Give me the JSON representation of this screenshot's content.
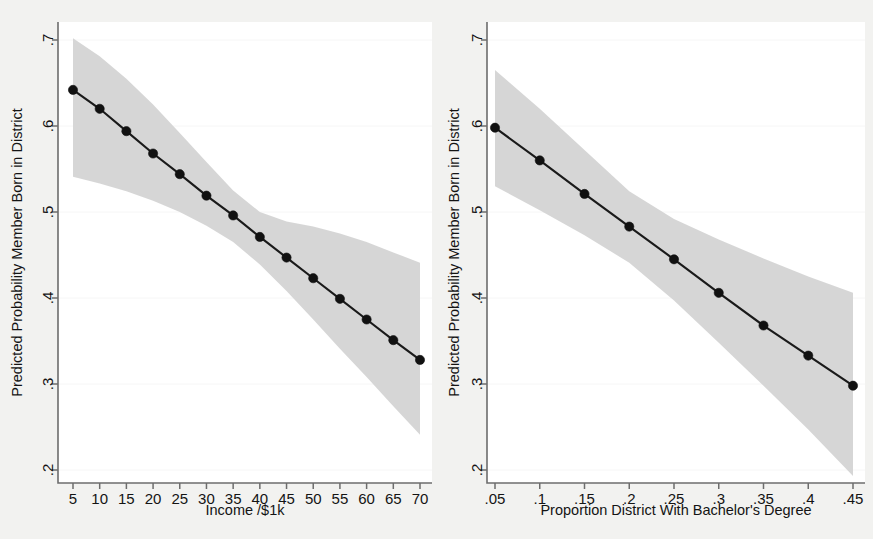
{
  "figure": {
    "background_color": "#f2f2f0",
    "plot_background_color": "#ffffff",
    "band_color": "#d4d4d4",
    "line_color": "#1a1a1a",
    "axis_color": "#6d6d6d"
  },
  "chart_data": [
    {
      "type": "line",
      "panel": "left",
      "title": "",
      "xlabel": "Income /$1k",
      "ylabel": "Predicted Probability Member Born in District",
      "xlim": [
        5,
        70
      ],
      "ylim": [
        0.2,
        0.7
      ],
      "xticks": [
        5,
        10,
        15,
        20,
        25,
        30,
        35,
        40,
        45,
        50,
        55,
        60,
        65,
        70
      ],
      "xticklabels": [
        "5",
        "10",
        "15",
        "20",
        "25",
        "30",
        "35",
        "40",
        "45",
        "50",
        "55",
        "60",
        "65",
        "70"
      ],
      "yticks": [
        0.2,
        0.3,
        0.4,
        0.5,
        0.6,
        0.7
      ],
      "yticklabels": [
        ".2",
        ".3",
        ".4",
        ".5",
        ".6",
        ".7"
      ],
      "grid": false,
      "legend": "none",
      "x": [
        5,
        10,
        15,
        20,
        25,
        30,
        35,
        40,
        45,
        50,
        55,
        60,
        65,
        70
      ],
      "values": [
        0.642,
        0.62,
        0.594,
        0.568,
        0.544,
        0.519,
        0.496,
        0.471,
        0.447,
        0.423,
        0.399,
        0.375,
        0.351,
        0.328
      ],
      "ci_upper": [
        0.702,
        0.681,
        0.655,
        0.625,
        0.592,
        0.558,
        0.525,
        0.5,
        0.489,
        0.483,
        0.475,
        0.465,
        0.453,
        0.441
      ],
      "ci_lower": [
        0.541,
        0.533,
        0.524,
        0.513,
        0.5,
        0.484,
        0.465,
        0.439,
        0.408,
        0.375,
        0.341,
        0.308,
        0.274,
        0.241
      ],
      "marker": "filled-circle",
      "band_label": "95% confidence interval"
    },
    {
      "type": "line",
      "panel": "right",
      "title": "",
      "xlabel": "Proportion District With Bachelor's Degree",
      "ylabel": "Predicted Probability Member Born in District",
      "xlim": [
        0.05,
        0.45
      ],
      "ylim": [
        0.2,
        0.7
      ],
      "xticks": [
        0.05,
        0.1,
        0.15,
        0.2,
        0.25,
        0.3,
        0.35,
        0.4,
        0.45
      ],
      "xticklabels": [
        ".05",
        ".1",
        ".15",
        ".2",
        ".25",
        ".3",
        ".35",
        ".4",
        ".45"
      ],
      "yticks": [
        0.2,
        0.3,
        0.4,
        0.5,
        0.6,
        0.7
      ],
      "yticklabels": [
        ".2",
        ".3",
        ".4",
        ".5",
        ".6",
        ".7"
      ],
      "grid": false,
      "legend": "none",
      "x": [
        0.05,
        0.1,
        0.15,
        0.2,
        0.25,
        0.3,
        0.35,
        0.4,
        0.45
      ],
      "values": [
        0.598,
        0.56,
        0.521,
        0.483,
        0.445,
        0.406,
        0.368,
        0.333,
        0.298
      ],
      "ci_upper": [
        0.665,
        0.62,
        0.572,
        0.524,
        0.492,
        0.468,
        0.446,
        0.425,
        0.406
      ],
      "ci_lower": [
        0.53,
        0.502,
        0.473,
        0.441,
        0.397,
        0.348,
        0.298,
        0.247,
        0.193
      ],
      "marker": "filled-circle",
      "band_label": "95% confidence interval"
    }
  ]
}
